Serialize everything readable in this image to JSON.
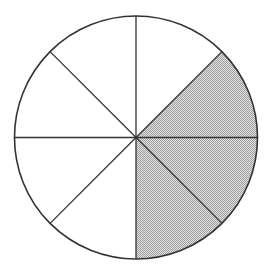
{
  "diagram": {
    "type": "fraction-circle",
    "total_slices": 8,
    "shaded_slices": 3,
    "fraction_label": "3/8",
    "center": [
      136,
      137.5
    ],
    "radius": 121.5,
    "slices": [
      {
        "index": 0,
        "from_deg": -90,
        "to_deg": -45,
        "shaded": false
      },
      {
        "index": 1,
        "from_deg": -45,
        "to_deg": 0,
        "shaded": true
      },
      {
        "index": 2,
        "from_deg": 0,
        "to_deg": 45,
        "shaded": true
      },
      {
        "index": 3,
        "from_deg": 45,
        "to_deg": 90,
        "shaded": true
      },
      {
        "index": 4,
        "from_deg": 90,
        "to_deg": 135,
        "shaded": false
      },
      {
        "index": 5,
        "from_deg": 135,
        "to_deg": 180,
        "shaded": false
      },
      {
        "index": 6,
        "from_deg": 180,
        "to_deg": 225,
        "shaded": false
      },
      {
        "index": 7,
        "from_deg": 225,
        "to_deg": 270,
        "shaded": false
      }
    ],
    "colors": {
      "stroke": "#333333",
      "fill_empty": "#ffffff",
      "fill_shaded_light": "#e6e6e6",
      "fill_shaded_dark": "#9a9a9a",
      "background": "#ffffff"
    }
  }
}
